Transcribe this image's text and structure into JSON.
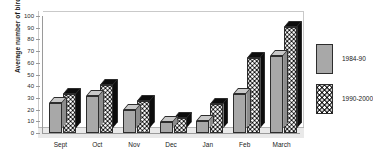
{
  "chart_data": {
    "type": "bar",
    "title": "",
    "xlabel": "",
    "ylabel": "Average number of birds",
    "ylim": [
      0,
      100
    ],
    "ytick_step": 10,
    "yticks": [
      100,
      90,
      80,
      70,
      60,
      50,
      40,
      30,
      20,
      10,
      0
    ],
    "grid": false,
    "legend_position": "right",
    "style": "3d-column",
    "categories": [
      "Sept",
      "Oct",
      "Nov",
      "Dec",
      "Jan",
      "Feb",
      "March"
    ],
    "series": [
      {
        "name": "1984-90",
        "fill": "solid-grey",
        "color": "#a8a8a8",
        "values": [
          26,
          32,
          20,
          9,
          10,
          33,
          66
        ]
      },
      {
        "name": "1990-2000",
        "fill": "black-white-checker",
        "color": "#0d0d0d",
        "values": [
          33,
          41,
          27,
          13,
          25,
          64,
          91
        ]
      }
    ]
  },
  "legend": {
    "items": [
      {
        "label": "1984-90"
      },
      {
        "label": "1990-2000"
      }
    ]
  },
  "axis": {
    "y_title": "Average number of birds"
  }
}
